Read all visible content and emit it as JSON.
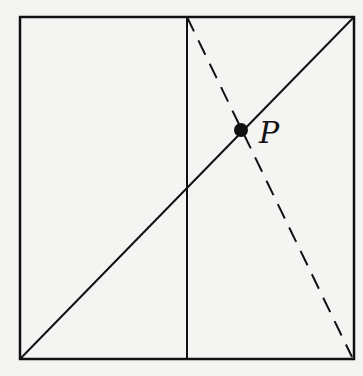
{
  "diagram": {
    "type": "geometry",
    "point_label": "P",
    "stroke_color": "#111111",
    "background": "#f4f4f2",
    "square": {
      "x1": 20,
      "y1": 17,
      "x2": 354,
      "y2": 359
    },
    "midline": {
      "x": 187
    },
    "diagonal": {
      "from": [
        20,
        359
      ],
      "to": [
        354,
        17
      ]
    },
    "dashed": {
      "from": [
        187,
        17
      ],
      "to": [
        352,
        357
      ]
    },
    "point": {
      "x": 241,
      "y": 130
    }
  }
}
